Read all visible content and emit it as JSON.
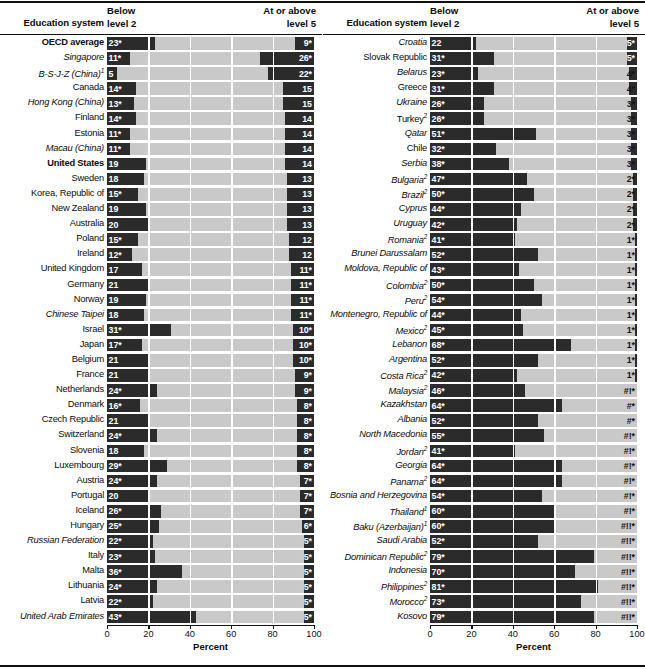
{
  "chart_data": {
    "type": "bar",
    "subtype": "diverging-stacked-bar",
    "title": "",
    "xlabel": "Percent",
    "ylabel": "Education system",
    "xlim": [
      0,
      100
    ],
    "xticks": [
      0,
      20,
      40,
      60,
      80,
      100
    ],
    "grid": true,
    "legend": null,
    "series": [
      {
        "name": "Below level 2",
        "anchor": "left"
      },
      {
        "name": "At or above level 5",
        "anchor": "right"
      }
    ],
    "panels": [
      {
        "id": "left-panel",
        "headers": {
          "category": "Education system",
          "left_series": "Below\nlevel 2",
          "right_series": "At or above\nlevel 5"
        },
        "axis_label": "Percent",
        "rows": [
          {
            "label": "OECD average",
            "style": "bold",
            "below": 23,
            "below_text": "23*",
            "above": 9,
            "above_text": "9*"
          },
          {
            "label": "Singapore",
            "style": "italic",
            "below": 11,
            "below_text": "11*",
            "above": 26,
            "above_text": "26*"
          },
          {
            "label": "B-S-J-Z (China)",
            "style": "italic",
            "sup": "1",
            "below": 5,
            "below_text": "5",
            "above": 22,
            "above_text": "22*"
          },
          {
            "label": "Canada",
            "style": "normal",
            "below": 14,
            "below_text": "14*",
            "above": 15,
            "above_text": "15"
          },
          {
            "label": "Hong Kong (China)",
            "style": "italic",
            "below": 13,
            "below_text": "13*",
            "above": 15,
            "above_text": "15"
          },
          {
            "label": "Finland",
            "style": "normal",
            "below": 14,
            "below_text": "14*",
            "above": 14,
            "above_text": "14"
          },
          {
            "label": "Estonia",
            "style": "normal",
            "below": 11,
            "below_text": "11*",
            "above": 14,
            "above_text": "14"
          },
          {
            "label": "Macau (China)",
            "style": "italic",
            "below": 11,
            "below_text": "11*",
            "above": 14,
            "above_text": "14"
          },
          {
            "label": "United States",
            "style": "bold",
            "below": 19,
            "below_text": "19",
            "above": 14,
            "above_text": "14"
          },
          {
            "label": "Sweden",
            "style": "normal",
            "below": 18,
            "below_text": "18",
            "above": 13,
            "above_text": "13"
          },
          {
            "label": "Korea, Republic of",
            "style": "normal",
            "below": 15,
            "below_text": "15*",
            "above": 13,
            "above_text": "13"
          },
          {
            "label": "New Zealand",
            "style": "normal",
            "below": 19,
            "below_text": "19",
            "above": 13,
            "above_text": "13"
          },
          {
            "label": "Australia",
            "style": "normal",
            "below": 20,
            "below_text": "20",
            "above": 13,
            "above_text": "13"
          },
          {
            "label": "Poland",
            "style": "normal",
            "below": 15,
            "below_text": "15*",
            "above": 12,
            "above_text": "12"
          },
          {
            "label": "Ireland",
            "style": "normal",
            "below": 12,
            "below_text": "12*",
            "above": 12,
            "above_text": "12"
          },
          {
            "label": "United Kingdom",
            "style": "normal",
            "below": 17,
            "below_text": "17",
            "above": 11,
            "above_text": "11*"
          },
          {
            "label": "Germany",
            "style": "normal",
            "below": 21,
            "below_text": "21",
            "above": 11,
            "above_text": "11*"
          },
          {
            "label": "Norway",
            "style": "normal",
            "below": 19,
            "below_text": "19",
            "above": 11,
            "above_text": "11*"
          },
          {
            "label": "Chinese Taipei",
            "style": "italic",
            "below": 18,
            "below_text": "18",
            "above": 11,
            "above_text": "11*"
          },
          {
            "label": "Israel",
            "style": "normal",
            "below": 31,
            "below_text": "31*",
            "above": 10,
            "above_text": "10*"
          },
          {
            "label": "Japan",
            "style": "normal",
            "below": 17,
            "below_text": "17*",
            "above": 10,
            "above_text": "10*"
          },
          {
            "label": "Belgium",
            "style": "normal",
            "below": 21,
            "below_text": "21",
            "above": 10,
            "above_text": "10*"
          },
          {
            "label": "France",
            "style": "normal",
            "below": 21,
            "below_text": "21",
            "above": 9,
            "above_text": "9*"
          },
          {
            "label": "Netherlands",
            "style": "normal",
            "below": 24,
            "below_text": "24*",
            "above": 9,
            "above_text": "9*"
          },
          {
            "label": "Denmark",
            "style": "normal",
            "below": 16,
            "below_text": "16*",
            "above": 8,
            "above_text": "8*"
          },
          {
            "label": "Czech Republic",
            "style": "normal",
            "below": 21,
            "below_text": "21",
            "above": 8,
            "above_text": "8*"
          },
          {
            "label": "Switzerland",
            "style": "normal",
            "below": 24,
            "below_text": "24*",
            "above": 8,
            "above_text": "8*"
          },
          {
            "label": "Slovenia",
            "style": "normal",
            "below": 18,
            "below_text": "18",
            "above": 8,
            "above_text": "8*"
          },
          {
            "label": "Luxembourg",
            "style": "normal",
            "below": 29,
            "below_text": "29*",
            "above": 8,
            "above_text": "8*"
          },
          {
            "label": "Austria",
            "style": "normal",
            "below": 24,
            "below_text": "24*",
            "above": 7,
            "above_text": "7*"
          },
          {
            "label": "Portugal",
            "style": "normal",
            "below": 20,
            "below_text": "20",
            "above": 7,
            "above_text": "7*"
          },
          {
            "label": "Iceland",
            "style": "normal",
            "below": 26,
            "below_text": "26*",
            "above": 7,
            "above_text": "7*"
          },
          {
            "label": "Hungary",
            "style": "normal",
            "below": 25,
            "below_text": "25*",
            "above": 6,
            "above_text": "6*"
          },
          {
            "label": "Russian Federation",
            "style": "italic",
            "below": 22,
            "below_text": "22*",
            "above": 5,
            "above_text": "5*"
          },
          {
            "label": "Italy",
            "style": "normal",
            "below": 23,
            "below_text": "23*",
            "above": 5,
            "above_text": "5*"
          },
          {
            "label": "Malta",
            "style": "normal",
            "below": 36,
            "below_text": "36*",
            "above": 5,
            "above_text": "5*"
          },
          {
            "label": "Lithuania",
            "style": "normal",
            "below": 24,
            "below_text": "24*",
            "above": 5,
            "above_text": "5*"
          },
          {
            "label": "Latvia",
            "style": "normal",
            "below": 22,
            "below_text": "22*",
            "above": 5,
            "above_text": "5*"
          },
          {
            "label": "United Arab Emirates",
            "style": "italic",
            "below": 43,
            "below_text": "43*",
            "above": 5,
            "above_text": "5*"
          }
        ]
      },
      {
        "id": "right-panel",
        "headers": {
          "category": "Education system",
          "left_series": "Below\nlevel 2",
          "right_series": "At or above\nlevel 5"
        },
        "axis_label": "Percent",
        "rows": [
          {
            "label": "Croatia",
            "style": "italic",
            "below": 22,
            "below_text": "22",
            "above": 5,
            "above_text": "5*"
          },
          {
            "label": "Slovak Republic",
            "style": "normal",
            "below": 31,
            "below_text": "31*",
            "above": 5,
            "above_text": "5*"
          },
          {
            "label": "Belarus",
            "style": "italic",
            "below": 23,
            "below_text": "23*",
            "above": 4,
            "above_text": "4*"
          },
          {
            "label": "Greece",
            "style": "normal",
            "below": 31,
            "below_text": "31*",
            "above": 4,
            "above_text": "4*"
          },
          {
            "label": "Ukraine",
            "style": "italic",
            "below": 26,
            "below_text": "26*",
            "above": 3,
            "above_text": "3*"
          },
          {
            "label": "Turkey",
            "style": "normal",
            "sup": "2",
            "below": 26,
            "below_text": "26*",
            "above": 3,
            "above_text": "3*"
          },
          {
            "label": "Qatar",
            "style": "italic",
            "below": 51,
            "below_text": "51*",
            "above": 3,
            "above_text": "3*"
          },
          {
            "label": "Chile",
            "style": "normal",
            "below": 32,
            "below_text": "32*",
            "above": 3,
            "above_text": "3*"
          },
          {
            "label": "Serbia",
            "style": "italic",
            "below": 38,
            "below_text": "38*",
            "above": 3,
            "above_text": "3*"
          },
          {
            "label": "Bulgaria",
            "style": "italic",
            "sup": "2",
            "below": 47,
            "below_text": "47*",
            "above": 2,
            "above_text": "2*"
          },
          {
            "label": "Brazil",
            "style": "italic",
            "sup": "2",
            "below": 50,
            "below_text": "50*",
            "above": 2,
            "above_text": "2*"
          },
          {
            "label": "Cyprus",
            "style": "italic",
            "below": 44,
            "below_text": "44*",
            "above": 2,
            "above_text": "2*"
          },
          {
            "label": "Uruguay",
            "style": "italic",
            "below": 42,
            "below_text": "42*",
            "above": 2,
            "above_text": "2*"
          },
          {
            "label": "Romania",
            "style": "italic",
            "sup": "2",
            "below": 41,
            "below_text": "41*",
            "above": 1,
            "above_text": "1*"
          },
          {
            "label": "Brunei Darussalam",
            "style": "italic",
            "below": 52,
            "below_text": "52*",
            "above": 1,
            "above_text": "1*"
          },
          {
            "label": "Moldova, Republic of",
            "style": "italic",
            "below": 43,
            "below_text": "43*",
            "above": 1,
            "above_text": "1*"
          },
          {
            "label": "Colombia",
            "style": "italic",
            "sup": "2",
            "below": 50,
            "below_text": "50*",
            "above": 1,
            "above_text": "1*"
          },
          {
            "label": "Peru",
            "style": "italic",
            "sup": "2",
            "below": 54,
            "below_text": "54*",
            "above": 1,
            "above_text": "1*"
          },
          {
            "label": "Montenegro, Republic of",
            "style": "italic",
            "below": 44,
            "below_text": "44*",
            "above": 1,
            "above_text": "1*"
          },
          {
            "label": "Mexico",
            "style": "italic",
            "sup": "2",
            "below": 45,
            "below_text": "45*",
            "above": 1,
            "above_text": "1*"
          },
          {
            "label": "Lebanon",
            "style": "italic",
            "below": 68,
            "below_text": "68*",
            "above": 1,
            "above_text": "1*"
          },
          {
            "label": "Argentina",
            "style": "italic",
            "below": 52,
            "below_text": "52*",
            "above": 1,
            "above_text": "1*"
          },
          {
            "label": "Costa Rica",
            "style": "italic",
            "sup": "2",
            "below": 42,
            "below_text": "42*",
            "above": 1,
            "above_text": "1*"
          },
          {
            "label": "Malaysia",
            "style": "italic",
            "sup": "2",
            "below": 46,
            "below_text": "46*",
            "above": 0,
            "above_text": "#!*"
          },
          {
            "label": "Kazakhstan",
            "style": "italic",
            "below": 64,
            "below_text": "64*",
            "above": 0,
            "above_text": "#*"
          },
          {
            "label": "Albania",
            "style": "italic",
            "below": 52,
            "below_text": "52*",
            "above": 0,
            "above_text": "#*"
          },
          {
            "label": "North Macedonia",
            "style": "italic",
            "below": 55,
            "below_text": "55*",
            "above": 0,
            "above_text": "#!*"
          },
          {
            "label": "Jordan",
            "style": "italic",
            "sup": "2",
            "below": 41,
            "below_text": "41*",
            "above": 0,
            "above_text": "#!*"
          },
          {
            "label": "Georgia",
            "style": "italic",
            "below": 64,
            "below_text": "64*",
            "above": 0,
            "above_text": "#!*"
          },
          {
            "label": "Panama",
            "style": "italic",
            "sup": "2",
            "below": 64,
            "below_text": "64*",
            "above": 0,
            "above_text": "#!*"
          },
          {
            "label": "Bosnia and Herzegovina",
            "style": "italic",
            "below": 54,
            "below_text": "54*",
            "above": 0,
            "above_text": "#!*"
          },
          {
            "label": "Thailand",
            "style": "italic",
            "sup": "1",
            "below": 60,
            "below_text": "60*",
            "above": 0,
            "above_text": "#!*"
          },
          {
            "label": "Baku (Azerbaijan)",
            "style": "italic",
            "sup": "1",
            "below": 60,
            "below_text": "60*",
            "above": 0,
            "above_text": "#!!*"
          },
          {
            "label": "Saudi Arabia",
            "style": "italic",
            "below": 52,
            "below_text": "52*",
            "above": 0,
            "above_text": "#!!*"
          },
          {
            "label": "Dominican Republic",
            "style": "italic",
            "sup": "2",
            "below": 79,
            "below_text": "79*",
            "above": 0,
            "above_text": "#!!*"
          },
          {
            "label": "Indonesia",
            "style": "italic",
            "below": 70,
            "below_text": "70*",
            "above": 0,
            "above_text": "#!!*"
          },
          {
            "label": "Philippines",
            "style": "italic",
            "sup": "2",
            "below": 81,
            "below_text": "81*",
            "above": 0,
            "above_text": "#!!*"
          },
          {
            "label": "Morocco",
            "style": "italic",
            "sup": "2",
            "below": 73,
            "below_text": "73*",
            "above": 0,
            "above_text": "#!!*"
          },
          {
            "label": "Kosovo",
            "style": "italic",
            "below": 79,
            "below_text": "79*",
            "above": 0,
            "above_text": "#!!*"
          }
        ]
      }
    ]
  },
  "colors": {
    "bar_dark": "#2b2b2b",
    "track_light": "#c9c9c9",
    "gridline": "#ffffff",
    "text": "#0c0c0c",
    "value_text_light": "#ffffff",
    "background": "#ffffff"
  }
}
